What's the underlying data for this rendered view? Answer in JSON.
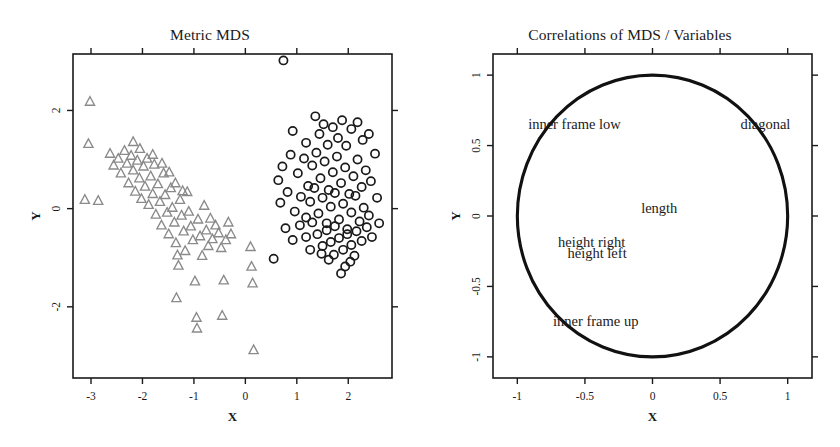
{
  "figure": {
    "background": "#ffffff",
    "panels": [
      {
        "id": "metric-mds",
        "title": "Metric MDS",
        "xlabel": "X",
        "ylabel": "Y"
      },
      {
        "id": "correlations",
        "title": "Correlations of MDS / Variables",
        "xlabel": "X",
        "ylabel": "Y"
      }
    ]
  },
  "chart_data": [
    {
      "type": "scatter",
      "title": "Metric MDS",
      "xlabel": "X",
      "ylabel": "Y",
      "xlim": [
        -3.35,
        2.85
      ],
      "ylim": [
        -3.45,
        3.15
      ],
      "xticks": [
        -3,
        -2,
        -1,
        0,
        1,
        2
      ],
      "xticklabels": [
        "-3",
        "-2",
        "-1",
        "0",
        "1",
        "2"
      ],
      "yticks": [
        2,
        0,
        -2
      ],
      "yticklabels": [
        "2",
        "0",
        "-2"
      ],
      "grid": false,
      "legend": "none",
      "series": [
        {
          "name": "group-triangles",
          "marker": "triangle",
          "color": "#8a8a8a",
          "points": [
            [
              -3.02,
              2.18
            ],
            [
              -3.05,
              1.32
            ],
            [
              -3.12,
              0.18
            ],
            [
              -2.86,
              0.16
            ],
            [
              -2.63,
              1.12
            ],
            [
              -2.56,
              0.88
            ],
            [
              -2.47,
              1.02
            ],
            [
              -2.42,
              0.72
            ],
            [
              -2.35,
              1.18
            ],
            [
              -2.3,
              0.92
            ],
            [
              -2.27,
              0.52
            ],
            [
              -2.22,
              1.08
            ],
            [
              -2.18,
              0.78
            ],
            [
              -2.14,
              0.35
            ],
            [
              -2.1,
              0.98
            ],
            [
              -2.06,
              0.62
            ],
            [
              -2.02,
              0.2
            ],
            [
              -1.98,
              0.86
            ],
            [
              -1.95,
              0.45
            ],
            [
              -1.91,
              1.02
            ],
            [
              -1.88,
              0.08
            ],
            [
              -1.84,
              0.66
            ],
            [
              -1.8,
              0.3
            ],
            [
              -1.77,
              0.9
            ],
            [
              -1.74,
              -0.12
            ],
            [
              -1.7,
              0.5
            ],
            [
              -1.66,
              0.14
            ],
            [
              -1.63,
              -0.34
            ],
            [
              -1.59,
              0.72
            ],
            [
              -1.56,
              0.28
            ],
            [
              -1.52,
              -0.08
            ],
            [
              -1.49,
              -0.52
            ],
            [
              -1.45,
              0.42
            ],
            [
              -1.42,
              0.02
            ],
            [
              -1.38,
              -0.28
            ],
            [
              -1.35,
              -0.7
            ],
            [
              -1.32,
              -0.95
            ],
            [
              -1.3,
              -1.16
            ],
            [
              -1.27,
              0.18
            ],
            [
              -1.24,
              -0.14
            ],
            [
              -1.2,
              -0.46
            ],
            [
              -1.17,
              -0.86
            ],
            [
              -1.13,
              0.34
            ],
            [
              -1.1,
              -0.06
            ],
            [
              -1.06,
              -0.36
            ],
            [
              -1.02,
              -0.64
            ],
            [
              -0.98,
              -1.48
            ],
            [
              -0.95,
              -2.22
            ],
            [
              -0.92,
              -0.22
            ],
            [
              -0.88,
              -0.56
            ],
            [
              -0.84,
              -0.96
            ],
            [
              -0.8,
              0.06
            ],
            [
              -0.76,
              -0.44
            ],
            [
              -0.72,
              -0.76
            ],
            [
              -0.68,
              -0.2
            ],
            [
              -0.64,
              -0.62
            ],
            [
              -0.58,
              -0.34
            ],
            [
              -0.52,
              -0.5
            ],
            [
              -0.47,
              -0.8
            ],
            [
              -0.42,
              -1.46
            ],
            [
              -0.38,
              -0.64
            ],
            [
              -0.33,
              -0.28
            ],
            [
              -0.28,
              -0.52
            ],
            [
              -0.94,
              -2.44
            ],
            [
              -1.34,
              -1.82
            ],
            [
              -0.45,
              -2.18
            ],
            [
              0.1,
              -0.78
            ],
            [
              0.12,
              -1.18
            ],
            [
              0.14,
              -1.52
            ],
            [
              0.16,
              -2.88
            ],
            [
              -2.18,
              1.36
            ],
            [
              -2.05,
              1.22
            ],
            [
              -1.8,
              1.1
            ],
            [
              -1.62,
              0.92
            ],
            [
              -1.48,
              0.74
            ],
            [
              -1.36,
              0.52
            ],
            [
              -1.22,
              0.36
            ]
          ]
        },
        {
          "name": "group-circles",
          "marker": "circle",
          "color": "#1a1a1a",
          "points": [
            [
              0.74,
              3.02
            ],
            [
              0.55,
              -1.02
            ],
            [
              0.92,
              1.58
            ],
            [
              1.18,
              1.34
            ],
            [
              1.36,
              1.88
            ],
            [
              1.44,
              1.52
            ],
            [
              1.52,
              1.72
            ],
            [
              1.6,
              1.3
            ],
            [
              1.7,
              1.66
            ],
            [
              1.8,
              1.44
            ],
            [
              1.88,
              1.8
            ],
            [
              1.96,
              1.28
            ],
            [
              2.06,
              1.62
            ],
            [
              2.18,
              1.76
            ],
            [
              2.28,
              1.4
            ],
            [
              2.4,
              1.52
            ],
            [
              0.72,
              0.86
            ],
            [
              0.88,
              1.1
            ],
            [
              1.02,
              0.72
            ],
            [
              1.14,
              1.02
            ],
            [
              1.22,
              0.46
            ],
            [
              1.3,
              0.88
            ],
            [
              1.38,
              1.14
            ],
            [
              1.46,
              0.62
            ],
            [
              1.54,
              0.96
            ],
            [
              1.62,
              0.38
            ],
            [
              1.7,
              0.74
            ],
            [
              1.78,
              1.06
            ],
            [
              1.86,
              0.52
            ],
            [
              1.94,
              0.84
            ],
            [
              2.02,
              0.3
            ],
            [
              2.1,
              0.66
            ],
            [
              2.18,
              1.0
            ],
            [
              2.26,
              0.44
            ],
            [
              2.34,
              0.78
            ],
            [
              2.44,
              0.56
            ],
            [
              0.68,
              0.12
            ],
            [
              0.82,
              0.34
            ],
            [
              0.96,
              -0.06
            ],
            [
              1.08,
              0.24
            ],
            [
              1.18,
              -0.18
            ],
            [
              1.26,
              0.14
            ],
            [
              1.34,
              0.42
            ],
            [
              1.42,
              -0.1
            ],
            [
              1.5,
              0.22
            ],
            [
              1.58,
              -0.3
            ],
            [
              1.66,
              0.04
            ],
            [
              1.74,
              0.32
            ],
            [
              1.82,
              -0.22
            ],
            [
              1.9,
              0.1
            ],
            [
              1.98,
              -0.42
            ],
            [
              2.06,
              -0.08
            ],
            [
              2.14,
              0.26
            ],
            [
              2.22,
              -0.26
            ],
            [
              2.3,
              0.02
            ],
            [
              2.4,
              -0.14
            ],
            [
              0.78,
              -0.4
            ],
            [
              0.92,
              -0.64
            ],
            [
              1.06,
              -0.34
            ],
            [
              1.18,
              -0.58
            ],
            [
              1.3,
              -0.28
            ],
            [
              1.4,
              -0.52
            ],
            [
              1.5,
              -0.76
            ],
            [
              1.58,
              -0.44
            ],
            [
              1.66,
              -0.68
            ],
            [
              1.74,
              -0.36
            ],
            [
              1.82,
              -0.6
            ],
            [
              1.9,
              -0.84
            ],
            [
              1.98,
              -0.52
            ],
            [
              2.06,
              -0.74
            ],
            [
              2.16,
              -0.46
            ],
            [
              2.26,
              -0.66
            ],
            [
              2.36,
              -0.38
            ],
            [
              2.46,
              -0.58
            ],
            [
              1.62,
              -1.04
            ],
            [
              1.72,
              -0.94
            ],
            [
              1.48,
              -0.92
            ],
            [
              2.04,
              -1.08
            ],
            [
              2.12,
              -0.96
            ],
            [
              1.26,
              -0.84
            ],
            [
              2.52,
              1.12
            ],
            [
              2.56,
              0.22
            ],
            [
              2.6,
              -0.3
            ],
            [
              0.64,
              0.58
            ],
            [
              1.94,
              -1.18
            ],
            [
              1.86,
              -1.32
            ]
          ]
        }
      ]
    },
    {
      "type": "scatter",
      "title": "Correlations of MDS / Variables",
      "xlabel": "X",
      "ylabel": "Y",
      "xlim": [
        -1.18,
        1.18
      ],
      "ylim": [
        -1.15,
        1.15
      ],
      "xticks": [
        -1,
        -0.5,
        0,
        0.5,
        1
      ],
      "xticklabels": [
        "-1",
        "-0.5",
        "0",
        "0.5",
        "1"
      ],
      "yticks": [
        1,
        0.5,
        0,
        -0.5,
        -1
      ],
      "yticklabels": [
        "1",
        "0.5",
        "0",
        "-0.5",
        "-1"
      ],
      "grid": false,
      "legend": "none",
      "unit_circle": {
        "radius": 1.0,
        "center": [
          0,
          0
        ]
      },
      "annotations": [
        {
          "label": "inner frame low",
          "x": -0.92,
          "y": 0.62,
          "anchor": "start"
        },
        {
          "label": "diagonal",
          "x": 1.02,
          "y": 0.62,
          "anchor": "end"
        },
        {
          "label": "length",
          "x": 0.05,
          "y": 0.02,
          "anchor": "middle"
        },
        {
          "label": "height right",
          "x": -0.45,
          "y": -0.22,
          "anchor": "middle"
        },
        {
          "label": "height left",
          "x": -0.41,
          "y": -0.3,
          "anchor": "middle"
        },
        {
          "label": "inner frame up",
          "x": -0.42,
          "y": -0.78,
          "anchor": "middle"
        }
      ]
    }
  ]
}
